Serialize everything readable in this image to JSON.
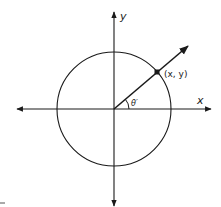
{
  "diagram": {
    "labels": {
      "y_axis": "y",
      "x_axis": "x",
      "point": "(x, y)",
      "angle": "θ′"
    },
    "geometry": {
      "origin": [
        114,
        109
      ],
      "radius": 57,
      "point": [
        157,
        72
      ],
      "ray_end": [
        188,
        46
      ]
    },
    "colors": {
      "stroke": "#1a1a1a",
      "background": "#ffffff"
    }
  }
}
